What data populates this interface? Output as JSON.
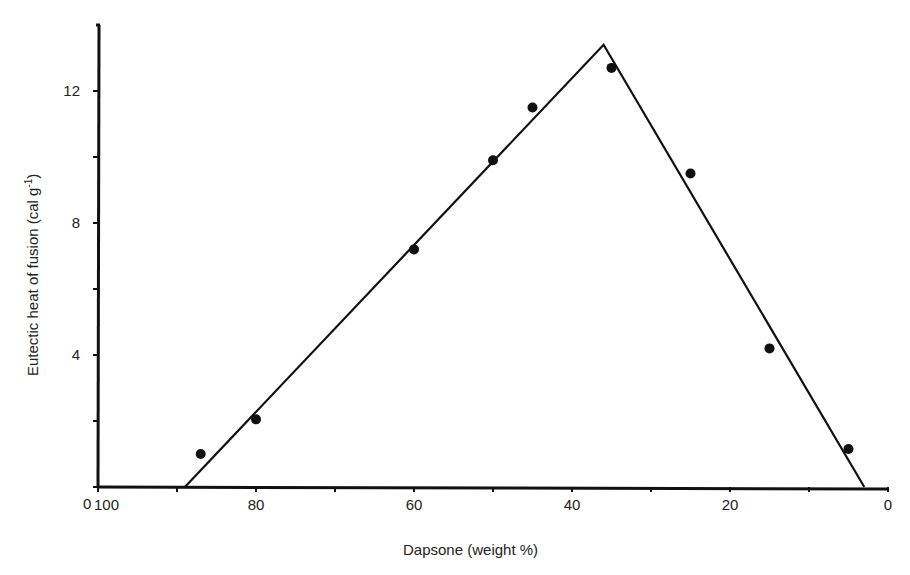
{
  "chart_data": {
    "type": "scatter",
    "title": "",
    "xlabel": "Dapsone (weight %)",
    "ylabel": "Eutectic heat of fusion (cal g⁻¹)",
    "ylabel_main": "Eutectic heat of fusion (cal g",
    "ylabel_sup": "-1",
    "ylabel_close": ")",
    "x_reversed": true,
    "xlim": [
      100,
      0
    ],
    "ylim": [
      0,
      14
    ],
    "grid": false,
    "legend": null,
    "origin_label": "0",
    "x_ticks": [
      100,
      90,
      80,
      70,
      60,
      50,
      40,
      30,
      20,
      10,
      0
    ],
    "x_tick_labels": [
      {
        "value": 100,
        "label": "100"
      },
      {
        "value": 80,
        "label": "80"
      },
      {
        "value": 60,
        "label": "60"
      },
      {
        "value": 40,
        "label": "40"
      },
      {
        "value": 20,
        "label": "20"
      },
      {
        "value": 0,
        "label": "0"
      }
    ],
    "y_ticks": [
      0,
      2,
      4,
      6,
      8,
      10,
      12
    ],
    "y_tick_labels": [
      {
        "value": 4,
        "label": "4"
      },
      {
        "value": 8,
        "label": "8"
      },
      {
        "value": 12,
        "label": "12"
      }
    ],
    "series": [
      {
        "name": "measured",
        "kind": "points",
        "points": [
          {
            "x": 87,
            "y": 1.0
          },
          {
            "x": 80,
            "y": 2.05
          },
          {
            "x": 60,
            "y": 7.2
          },
          {
            "x": 50,
            "y": 9.9
          },
          {
            "x": 45,
            "y": 11.5
          },
          {
            "x": 35,
            "y": 12.7
          },
          {
            "x": 25,
            "y": 9.5
          },
          {
            "x": 15,
            "y": 4.2
          },
          {
            "x": 5,
            "y": 1.15
          }
        ]
      },
      {
        "name": "tammann-triangle",
        "kind": "line",
        "points": [
          {
            "x": 89,
            "y": 0
          },
          {
            "x": 36,
            "y": 13.4
          },
          {
            "x": 3,
            "y": 0
          }
        ]
      }
    ]
  },
  "colors": {
    "ink": "#111111",
    "text": "#222222",
    "background": "#ffffff"
  }
}
